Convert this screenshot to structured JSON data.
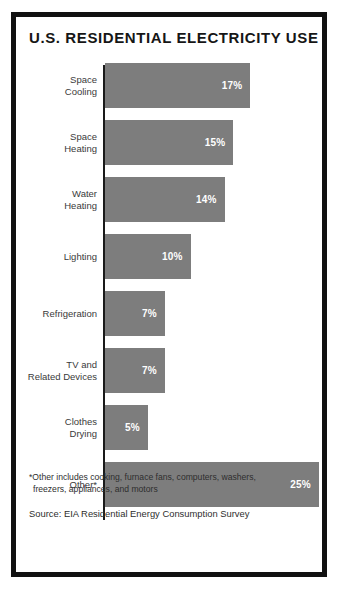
{
  "poster": {
    "title": "U.S. RESIDENTIAL ELECTRICITY USE",
    "footnote_line1": "*Other includes cooking, furnace fans, computers, washers,",
    "footnote_line2": "freezers, appliances, and motors",
    "source": "Source: EIA Residential Energy Consumption Survey",
    "bar_color": "#7d7d7d",
    "frame_color": "#111111",
    "value_label_color": "#ffffff"
  },
  "chart_data": {
    "type": "bar",
    "orientation": "horizontal",
    "title": "U.S. RESIDENTIAL ELECTRICITY USE",
    "xlabel": "",
    "ylabel": "",
    "xlim": [
      0,
      25
    ],
    "grid": false,
    "legend": null,
    "categories": [
      "Space Cooling",
      "Space Heating",
      "Water Heating",
      "Lighting",
      "Refrigeration",
      "TV and Related Devices",
      "Clothes Drying",
      "Other*"
    ],
    "values": [
      17,
      15,
      14,
      10,
      7,
      7,
      5,
      25
    ],
    "value_labels": [
      "17%",
      "15%",
      "14%",
      "10%",
      "7%",
      "7%",
      "5%",
      "25%"
    ],
    "bars": [
      {
        "label_line1": "Space",
        "label_line2": "Cooling",
        "value": 17,
        "value_label": "17%"
      },
      {
        "label_line1": "Space",
        "label_line2": "Heating",
        "value": 15,
        "value_label": "15%"
      },
      {
        "label_line1": "Water",
        "label_line2": "Heating",
        "value": 14,
        "value_label": "14%"
      },
      {
        "label_line1": "Lighting",
        "label_line2": "",
        "value": 10,
        "value_label": "10%"
      },
      {
        "label_line1": "Refrigeration",
        "label_line2": "",
        "value": 7,
        "value_label": "7%"
      },
      {
        "label_line1": "TV and",
        "label_line2": "Related Devices",
        "value": 7,
        "value_label": "7%"
      },
      {
        "label_line1": "Clothes",
        "label_line2": "Drying",
        "value": 5,
        "value_label": "5%"
      },
      {
        "label_line1": "Other*",
        "label_line2": "",
        "value": 25,
        "value_label": "25%"
      }
    ]
  }
}
